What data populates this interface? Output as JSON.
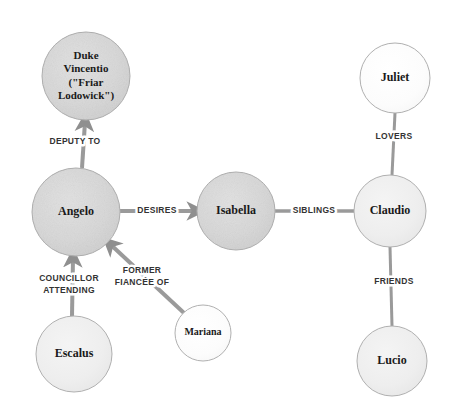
{
  "diagram": {
    "type": "character-relationship-graph",
    "background_color": "#ffffff",
    "node_fill_dark": "#d8d8d8",
    "node_fill_light": "#f0f0f0",
    "node_fill_white": "#fbfbfb",
    "node_stroke": "#b0b0b0",
    "edge_color": "#9a9a9a",
    "label_color": "#333333",
    "nodes": [
      {
        "id": "duke",
        "lines": [
          "Duke",
          "Vincentio",
          "(\"Friar",
          "Lodowick\")"
        ],
        "name": "Duke Vincentio (\"Friar Lodowick\")",
        "cx": 86,
        "cy": 76,
        "r": 44,
        "shade": "dark",
        "font_size": 11
      },
      {
        "id": "angelo",
        "lines": [
          "Angelo"
        ],
        "name": "Angelo",
        "cx": 76,
        "cy": 212,
        "r": 44,
        "shade": "dark",
        "font_size": 12
      },
      {
        "id": "isabella",
        "lines": [
          "Isabella"
        ],
        "name": "Isabella",
        "cx": 236,
        "cy": 211,
        "r": 39,
        "shade": "dark",
        "font_size": 12
      },
      {
        "id": "claudio",
        "lines": [
          "Claudio"
        ],
        "name": "Claudio",
        "cx": 390,
        "cy": 211,
        "r": 36,
        "shade": "light",
        "font_size": 12
      },
      {
        "id": "juliet",
        "lines": [
          "Juliet"
        ],
        "name": "Juliet",
        "cx": 395,
        "cy": 78,
        "r": 35,
        "shade": "white",
        "font_size": 12
      },
      {
        "id": "lucio",
        "lines": [
          "Lucio"
        ],
        "name": "Lucio",
        "cx": 392,
        "cy": 361,
        "r": 35,
        "shade": "light",
        "font_size": 12
      },
      {
        "id": "escalus",
        "lines": [
          "Escalus"
        ],
        "name": "Escalus",
        "cx": 74,
        "cy": 354,
        "r": 38,
        "shade": "light",
        "font_size": 12
      },
      {
        "id": "mariana",
        "lines": [
          "Mariana"
        ],
        "name": "Mariana",
        "cx": 203,
        "cy": 333,
        "r": 28,
        "shade": "white",
        "font_size": 10
      }
    ],
    "edges": [
      {
        "id": "angelo-duke",
        "from": "angelo",
        "to": "duke",
        "label_lines": [
          "DEPUTY TO"
        ],
        "label_x": 75,
        "label_y": 142,
        "arrow": true,
        "x1": 82,
        "y1": 168,
        "x2": 85,
        "y2": 122,
        "width": 4,
        "font_size": 8.5
      },
      {
        "id": "angelo-isabella",
        "from": "angelo",
        "to": "isabella",
        "label_lines": [
          "DESIRES"
        ],
        "label_x": 157,
        "label_y": 211,
        "arrow": true,
        "x1": 120,
        "y1": 211,
        "x2": 196,
        "y2": 211,
        "width": 4,
        "font_size": 8.5
      },
      {
        "id": "isabella-claudio",
        "from": "isabella",
        "to": "claudio",
        "label_lines": [
          "SIBLINGS"
        ],
        "label_x": 314,
        "label_y": 211,
        "arrow": false,
        "x1": 275,
        "y1": 211,
        "x2": 354,
        "y2": 211,
        "width": 3.5,
        "font_size": 8.5
      },
      {
        "id": "claudio-juliet",
        "from": "claudio",
        "to": "juliet",
        "label_lines": [
          "LOVERS"
        ],
        "label_x": 394,
        "label_y": 137,
        "arrow": false,
        "x1": 392,
        "y1": 175,
        "x2": 395,
        "y2": 113,
        "width": 3,
        "font_size": 8.5
      },
      {
        "id": "claudio-lucio",
        "from": "claudio",
        "to": "lucio",
        "label_lines": [
          "FRIENDS"
        ],
        "label_x": 394,
        "label_y": 282,
        "arrow": false,
        "x1": 390,
        "y1": 247,
        "x2": 392,
        "y2": 326,
        "width": 3,
        "font_size": 8.5
      },
      {
        "id": "escalus-angelo",
        "from": "escalus",
        "to": "angelo",
        "label_lines": [
          "COUNCILLOR",
          "ATTENDING"
        ],
        "label_x": 69,
        "label_y": 285,
        "arrow": true,
        "x1": 72,
        "y1": 316,
        "x2": 73,
        "y2": 258,
        "width": 4,
        "font_size": 8.5
      },
      {
        "id": "mariana-angelo",
        "from": "mariana",
        "to": "angelo",
        "label_lines": [
          "FORMER",
          "FIANCÉE OF"
        ],
        "label_x": 142,
        "label_y": 277,
        "arrow": true,
        "x1": 184,
        "y1": 313,
        "x2": 110,
        "y2": 244,
        "width": 4,
        "font_size": 8.5
      }
    ]
  }
}
